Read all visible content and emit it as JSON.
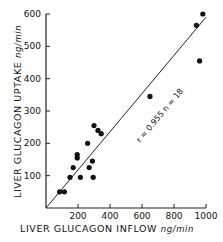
{
  "chart_data": {
    "type": "scatter",
    "title": "",
    "xlabel": "LIVER GLUCAGON INFLOW",
    "xunit": "ng/min",
    "ylabel": "LIVER GLUCAGON UPTAKE",
    "yunit": "ng/min",
    "xlim": [
      0,
      1000
    ],
    "ylim": [
      0,
      600
    ],
    "xticks": [
      200,
      400,
      600,
      800,
      1000
    ],
    "yticks": [
      100,
      200,
      300,
      400,
      500,
      600
    ],
    "grid": false,
    "legend": "none",
    "annotation": "r = 0.955   n = 18",
    "regression_line": {
      "x": [
        0,
        1000
      ],
      "y": [
        0,
        590
      ]
    },
    "points": [
      {
        "x": 85,
        "y": 50
      },
      {
        "x": 115,
        "y": 50
      },
      {
        "x": 150,
        "y": 95
      },
      {
        "x": 170,
        "y": 125
      },
      {
        "x": 195,
        "y": 155
      },
      {
        "x": 195,
        "y": 165
      },
      {
        "x": 215,
        "y": 95
      },
      {
        "x": 260,
        "y": 200
      },
      {
        "x": 270,
        "y": 125
      },
      {
        "x": 290,
        "y": 145
      },
      {
        "x": 295,
        "y": 95
      },
      {
        "x": 300,
        "y": 255
      },
      {
        "x": 325,
        "y": 240
      },
      {
        "x": 345,
        "y": 230
      },
      {
        "x": 650,
        "y": 345
      },
      {
        "x": 940,
        "y": 565
      },
      {
        "x": 960,
        "y": 455
      },
      {
        "x": 980,
        "y": 600
      }
    ]
  },
  "labels": {
    "xlabel": "LIVER GLUCAGON INFLOW",
    "xunit": "ng/min",
    "ylabel": "LIVER GLUCAGON UPTAKE",
    "yunit": "ng/min",
    "annotation": "r = 0.955   n = 18"
  }
}
